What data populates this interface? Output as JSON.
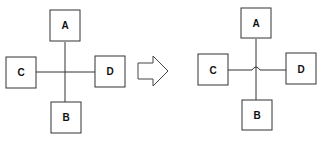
{
  "diagram": {
    "left": {
      "title": "crossing without jump",
      "boxes": [
        {
          "id": "A",
          "label": "A"
        },
        {
          "id": "B",
          "label": "B"
        },
        {
          "id": "C",
          "label": "C"
        },
        {
          "id": "D",
          "label": "D"
        }
      ],
      "connections": [
        [
          "A",
          "B"
        ],
        [
          "C",
          "D"
        ]
      ]
    },
    "arrow": {
      "icon": "right-arrow-icon"
    },
    "right": {
      "title": "crossing with line jump",
      "boxes": [
        {
          "id": "A",
          "label": "A"
        },
        {
          "id": "B",
          "label": "B"
        },
        {
          "id": "C",
          "label": "C"
        },
        {
          "id": "D",
          "label": "D"
        }
      ],
      "connections": [
        [
          "A",
          "B"
        ],
        [
          "C",
          "D"
        ]
      ],
      "line_jump": true
    },
    "colors": {
      "stroke": "#333333",
      "background": "#ffffff"
    }
  }
}
